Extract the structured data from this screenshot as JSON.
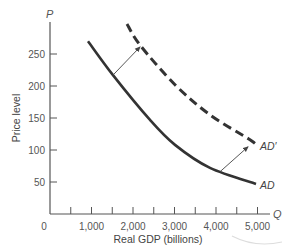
{
  "chart_data": {
    "type": "line",
    "title": "",
    "xlabel": "Real GDP (billions)",
    "ylabel": "Price level",
    "x_axis_var": "Q",
    "y_axis_var": "P",
    "xlim": [
      0,
      5200
    ],
    "ylim": [
      0,
      300
    ],
    "x_ticks": [
      500,
      1000,
      1500,
      2000,
      2500,
      3000,
      3500,
      4000,
      4500,
      5000
    ],
    "x_tick_labels": [
      {
        "value": 0,
        "label": "0"
      },
      {
        "value": 1000,
        "label": "1,000"
      },
      {
        "value": 2000,
        "label": "2,000"
      },
      {
        "value": 3000,
        "label": "3,000"
      },
      {
        "value": 4000,
        "label": "4,000"
      },
      {
        "value": 5000,
        "label": "5,000"
      }
    ],
    "y_ticks": [
      {
        "value": 50,
        "label": "50"
      },
      {
        "value": 100,
        "label": "100"
      },
      {
        "value": 150,
        "label": "150"
      },
      {
        "value": 200,
        "label": "200"
      },
      {
        "value": 250,
        "label": "250"
      }
    ],
    "grid": false,
    "series": [
      {
        "name": "AD",
        "style": "solid",
        "color": "#333333",
        "x": [
          916,
          1518,
          2410,
          3012,
          3855,
          4964
        ],
        "y": [
          270,
          217,
          147,
          108,
          72,
          47
        ]
      },
      {
        "name": "AD′",
        "style": "dashed",
        "color": "#333333",
        "x": [
          1855,
          2169,
          3012,
          3855,
          4819,
          5000
        ],
        "y": [
          297,
          264,
          202,
          155,
          116,
          106
        ]
      }
    ],
    "annotations": [
      {
        "type": "arrow",
        "from": [
          1518,
          217
        ],
        "to": [
          2169,
          261
        ],
        "label": "shift AD to AD′ (upper)"
      },
      {
        "type": "arrow",
        "from": [
          4096,
          66
        ],
        "to": [
          4771,
          105
        ],
        "label": "shift AD to AD′ (lower)"
      }
    ]
  },
  "labels": {
    "ad": "AD",
    "ad_prime": "AD′"
  }
}
